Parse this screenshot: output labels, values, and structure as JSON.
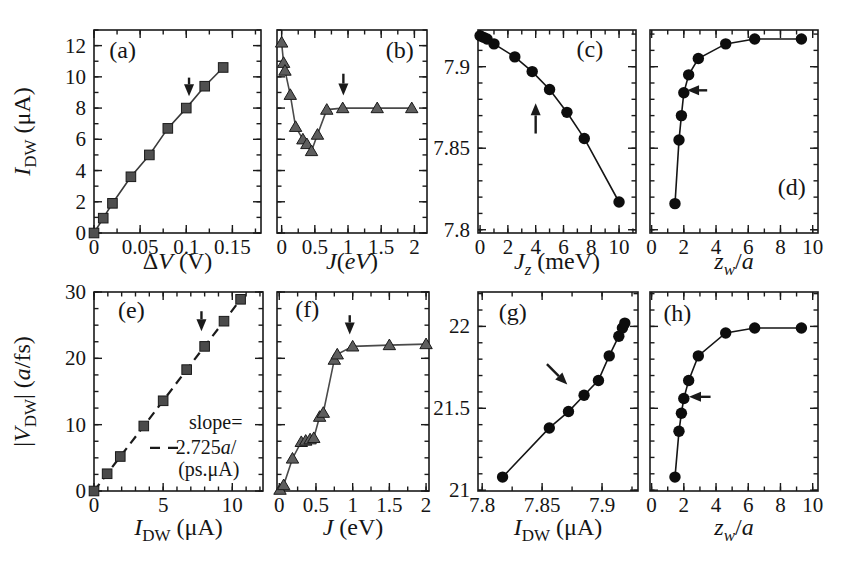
{
  "figure": {
    "width": 862,
    "height": 576,
    "background": "#ffffff",
    "axis_color": "#1a1a1a",
    "tick_font_size": 21,
    "title_font_size": 24,
    "label_font_size": 24
  },
  "chart_data": [
    {
      "id": "a",
      "type": "line",
      "label": "(a)",
      "label_xy": [
        0.031,
        11.2
      ],
      "rect": [
        94,
        30,
        261,
        233
      ],
      "x": {
        "lim": [
          0,
          0.181
        ],
        "major": [
          0,
          0.05,
          0.1,
          0.15
        ],
        "labels": [
          "0",
          "0.05",
          "0.1",
          "0.15"
        ],
        "minor": 0.025,
        "title": [
          [
            "Δ",
            "n"
          ],
          [
            "V",
            "i"
          ],
          [
            " (V)",
            "n"
          ]
        ],
        "title_dy": 36
      },
      "y": {
        "lim": [
          0,
          13
        ],
        "major": [
          0,
          2,
          4,
          6,
          8,
          10,
          12
        ],
        "labels": [
          "0",
          "2",
          "4",
          "6",
          "8",
          "10",
          "12"
        ],
        "minor": 1,
        "title": [
          [
            "I",
            "i"
          ],
          [
            "DW",
            "sub"
          ],
          [
            " (μA)",
            "n"
          ]
        ]
      },
      "series": {
        "marker": "square",
        "line": "solid",
        "line_color": "#3a3a3a",
        "marker_fill": "#4f4f4f",
        "points": [
          [
            0,
            0
          ],
          [
            0.01,
            0.95
          ],
          [
            0.02,
            1.9
          ],
          [
            0.04,
            3.6
          ],
          [
            0.06,
            5.0
          ],
          [
            0.08,
            6.7
          ],
          [
            0.1,
            8.0
          ],
          [
            0.12,
            9.4
          ],
          [
            0.14,
            10.6
          ]
        ]
      },
      "arrow": {
        "from": [
          0.103,
          9.95
        ],
        "to": [
          0.103,
          8.75
        ]
      }
    },
    {
      "id": "b",
      "type": "line",
      "label": "(b)",
      "label_xy": [
        1.78,
        11.2
      ],
      "rect": [
        277,
        30,
        427,
        233
      ],
      "x": {
        "lim": [
          -0.07,
          2.19
        ],
        "major": [
          0,
          0.5,
          1,
          1.5,
          2
        ],
        "labels": [
          "0",
          "0.5",
          "1",
          "1.5",
          "2"
        ],
        "minor": 0.25,
        "title": [
          [
            "J",
            "i"
          ],
          [
            "(",
            "n"
          ],
          [
            "eV",
            "i"
          ],
          [
            ")",
            "n"
          ]
        ],
        "title_dy": 36
      },
      "y": {
        "lim": [
          0,
          13
        ],
        "major": [
          0,
          2,
          4,
          6,
          8,
          10,
          12
        ],
        "labels": null,
        "minor": 1
      },
      "series": {
        "marker": "triangle",
        "line": "solid",
        "line_color": "#4a4a4a",
        "marker_fill": "#5e5e5e",
        "points": [
          [
            0,
            12.2
          ],
          [
            0.03,
            10.9
          ],
          [
            0.05,
            10.4
          ],
          [
            0.13,
            8.85
          ],
          [
            0.21,
            6.8
          ],
          [
            0.32,
            6.0
          ],
          [
            0.38,
            5.7
          ],
          [
            0.45,
            5.25
          ],
          [
            0.54,
            6.3
          ],
          [
            0.68,
            7.9
          ],
          [
            0.92,
            8.0
          ],
          [
            1.44,
            8.0
          ],
          [
            1.96,
            8.0
          ]
        ]
      },
      "arrow": {
        "from": [
          0.93,
          10.2
        ],
        "to": [
          0.93,
          8.8
        ]
      }
    },
    {
      "id": "c",
      "type": "line",
      "label": "(c)",
      "label_xy": [
        7.9,
        7.906
      ],
      "rect": [
        478,
        30,
        636,
        233
      ],
      "x": {
        "lim": [
          -0.15,
          11.22
        ],
        "major": [
          0,
          2,
          4,
          6,
          8,
          10
        ],
        "labels": [
          "0",
          "2",
          "4",
          "6",
          "8",
          "10"
        ],
        "minor": 1,
        "title": [
          [
            "J",
            "i"
          ],
          [
            "z",
            "subi"
          ],
          [
            " (meV)",
            "n"
          ]
        ],
        "title_dy": 36
      },
      "y": {
        "lim": [
          7.798,
          7.9225
        ],
        "major": [
          7.8,
          7.85,
          7.9
        ],
        "labels": [
          "7.8",
          "7.85",
          "7.9"
        ],
        "minor": 0.01
      },
      "series": {
        "marker": "circle",
        "line": "solid",
        "line_color": "#151515",
        "marker_fill": "#0d0d0d",
        "points": [
          [
            0,
            7.919
          ],
          [
            0.25,
            7.918
          ],
          [
            0.5,
            7.917
          ],
          [
            1,
            7.914
          ],
          [
            2.5,
            7.906
          ],
          [
            3.75,
            7.897
          ],
          [
            5,
            7.886
          ],
          [
            6.25,
            7.872
          ],
          [
            7.5,
            7.856
          ],
          [
            10,
            7.817
          ]
        ]
      },
      "arrow": {
        "from": [
          4.0,
          7.859
        ],
        "to": [
          4.0,
          7.8775
        ]
      }
    },
    {
      "id": "d",
      "type": "line",
      "label": "(d)",
      "label_xy": [
        8.7,
        7.8215
      ],
      "rect": [
        650,
        30,
        818,
        233
      ],
      "x": {
        "lim": [
          -0.1,
          10.33
        ],
        "major": [
          0,
          2,
          4,
          6,
          8,
          10
        ],
        "labels": [
          "0",
          "2",
          "4",
          "6",
          "8",
          "10"
        ],
        "minor": 1,
        "title": [
          [
            "z",
            "i"
          ],
          [
            "w",
            "subi"
          ],
          [
            "/",
            "n"
          ],
          [
            "a",
            "i"
          ]
        ],
        "title_dy": 36
      },
      "y": {
        "lim": [
          7.798,
          7.9225
        ],
        "major": [
          7.8,
          7.85,
          7.9
        ],
        "labels": null,
        "minor": 0.01
      },
      "series": {
        "marker": "circle",
        "line": "solid",
        "line_color": "#151515",
        "marker_fill": "#0d0d0d",
        "points": [
          [
            1.45,
            7.816
          ],
          [
            1.7,
            7.855
          ],
          [
            1.85,
            7.87
          ],
          [
            2.0,
            7.884
          ],
          [
            2.3,
            7.895
          ],
          [
            2.9,
            7.905
          ],
          [
            4.6,
            7.914
          ],
          [
            6.4,
            7.917
          ],
          [
            9.3,
            7.917
          ]
        ]
      },
      "arrow": {
        "from": [
          3.45,
          7.8855
        ],
        "to": [
          2.2,
          7.8855
        ]
      }
    },
    {
      "id": "e",
      "type": "line",
      "label": "(e)",
      "label_xy": [
        2.7,
        26.1
      ],
      "rect": [
        94,
        292,
        263,
        491
      ],
      "x": {
        "lim": [
          0,
          12.22
        ],
        "major": [
          0,
          5,
          10
        ],
        "labels": [
          "0",
          "5",
          "10"
        ],
        "minor": 1,
        "title": [
          [
            "I",
            "i"
          ],
          [
            "DW",
            "sub"
          ],
          [
            " (μA)",
            "n"
          ]
        ],
        "title_dy": 44
      },
      "y": {
        "lim": [
          0,
          30
        ],
        "major": [
          0,
          10,
          20,
          30
        ],
        "labels": [
          "0",
          "10",
          "20",
          "30"
        ],
        "minor": 2.5,
        "title": [
          [
            "|",
            "n"
          ],
          [
            "V",
            "i"
          ],
          [
            "DW",
            "sub"
          ],
          [
            "| (",
            "n"
          ],
          [
            "a",
            "i"
          ],
          [
            "/fs)",
            "n"
          ]
        ]
      },
      "series": {
        "marker": "square",
        "line": "dashed",
        "line_color": "#1a1a1a",
        "marker_fill": "#4a4a4a",
        "points": [
          [
            0,
            0
          ],
          [
            0.95,
            2.6
          ],
          [
            1.9,
            5.2
          ],
          [
            3.6,
            9.8
          ],
          [
            5.0,
            13.6
          ],
          [
            6.7,
            18.3
          ],
          [
            8.0,
            21.8
          ],
          [
            9.4,
            25.6
          ],
          [
            10.6,
            28.9
          ]
        ]
      },
      "arrow": {
        "from": [
          7.77,
          27.1
        ],
        "to": [
          7.77,
          24.1
        ]
      },
      "legend": {
        "dash": {
          "from": [
            4.05,
            6.5
          ],
          "to": [
            6.4,
            6.5
          ]
        },
        "lines": [
          {
            "xy": [
              8.8,
              9.3
            ],
            "segs": [
              [
                "slope=",
                "n"
              ]
            ]
          },
          {
            "xy": [
              8.1,
              5.6
            ],
            "segs": [
              [
                "2.725",
                "n"
              ],
              [
                "a",
                "i"
              ],
              [
                "/",
                "n"
              ]
            ]
          },
          {
            "xy": [
              8.3,
              2.2
            ],
            "segs": [
              [
                "(ps.μA)",
                "n"
              ]
            ]
          }
        ]
      }
    },
    {
      "id": "f",
      "type": "line",
      "label": "(f)",
      "label_xy": [
        0.38,
        26.2
      ],
      "rect": [
        277,
        292,
        429,
        491
      ],
      "x": {
        "lim": [
          -0.031,
          2.04
        ],
        "major": [
          0,
          0.5,
          1,
          1.5,
          2
        ],
        "labels": [
          "0",
          "0.5",
          "1",
          "1.5",
          "2"
        ],
        "minor": 0.25,
        "title": [
          [
            "J",
            "i"
          ],
          [
            " (eV)",
            "n"
          ]
        ],
        "title_dy": 44
      },
      "y": {
        "lim": [
          0,
          30
        ],
        "major": [
          0,
          10,
          20,
          30
        ],
        "labels": null,
        "minor": 2.5
      },
      "series": {
        "marker": "triangle",
        "line": "solid",
        "line_color": "#4a4a4a",
        "marker_fill": "#5e5e5e",
        "points": [
          [
            0.01,
            0.2
          ],
          [
            0.06,
            0.9
          ],
          [
            0.18,
            4.9
          ],
          [
            0.3,
            7.4
          ],
          [
            0.36,
            7.6
          ],
          [
            0.42,
            7.8
          ],
          [
            0.47,
            8.0
          ],
          [
            0.55,
            11.2
          ],
          [
            0.6,
            11.8
          ],
          [
            0.75,
            19.8
          ],
          [
            0.79,
            20.6
          ],
          [
            1.0,
            21.8
          ],
          [
            1.5,
            22.0
          ],
          [
            2.0,
            22.15
          ]
        ]
      },
      "arrow": {
        "from": [
          0.96,
          26.5
        ],
        "to": [
          0.96,
          23.6
        ]
      }
    },
    {
      "id": "g",
      "type": "line",
      "label": "(g)",
      "label_xy": [
        7.8255,
        22.04
      ],
      "rect": [
        478,
        292,
        638,
        491
      ],
      "x": {
        "lim": [
          7.7965,
          7.93
        ],
        "major": [
          7.8,
          7.85,
          7.9
        ],
        "labels": [
          "7.8",
          "7.85",
          "7.9"
        ],
        "minor": 0.025,
        "title": [
          [
            "I",
            "i"
          ],
          [
            "DW",
            "sub"
          ],
          [
            " (μA)",
            "n"
          ]
        ],
        "title_dy": 44
      },
      "y": {
        "lim": [
          20.995,
          22.21
        ],
        "major": [
          21,
          21.5,
          22
        ],
        "labels": [
          "21",
          "21.5",
          "22"
        ],
        "minor": 0.1
      },
      "series": {
        "marker": "circle",
        "line": "solid",
        "line_color": "#151515",
        "marker_fill": "#0d0d0d",
        "points": [
          [
            7.817,
            21.08
          ],
          [
            7.856,
            21.38
          ],
          [
            7.872,
            21.48
          ],
          [
            7.885,
            21.58
          ],
          [
            7.897,
            21.67
          ],
          [
            7.906,
            21.82
          ],
          [
            7.914,
            21.94
          ],
          [
            7.917,
            21.99
          ],
          [
            7.919,
            22.02
          ]
        ]
      },
      "arrow": {
        "from": [
          7.854,
          21.77
        ],
        "to": [
          7.871,
          21.645
        ]
      }
    },
    {
      "id": "h",
      "type": "line",
      "label": "(h)",
      "label_xy": [
        1.6,
        22.03
      ],
      "rect": [
        650,
        292,
        818,
        491
      ],
      "x": {
        "lim": [
          -0.1,
          10.33
        ],
        "major": [
          0,
          2,
          4,
          6,
          8,
          10
        ],
        "labels": [
          "0",
          "2",
          "4",
          "6",
          "8",
          "10"
        ],
        "minor": 1,
        "title": [
          [
            "z",
            "i"
          ],
          [
            "w",
            "subi"
          ],
          [
            "/",
            "n"
          ],
          [
            "a",
            "i"
          ]
        ],
        "title_dy": 44
      },
      "y": {
        "lim": [
          20.995,
          22.21
        ],
        "major": [
          21,
          21.5,
          22
        ],
        "labels": null,
        "minor": 0.1
      },
      "series": {
        "marker": "circle",
        "line": "solid",
        "line_color": "#151515",
        "marker_fill": "#0d0d0d",
        "points": [
          [
            1.45,
            21.08
          ],
          [
            1.7,
            21.36
          ],
          [
            1.85,
            21.47
          ],
          [
            2.0,
            21.56
          ],
          [
            2.3,
            21.67
          ],
          [
            2.9,
            21.82
          ],
          [
            4.6,
            21.96
          ],
          [
            6.4,
            21.99
          ],
          [
            9.3,
            21.99
          ]
        ]
      },
      "arrow": {
        "from": [
          3.66,
          21.57
        ],
        "to": [
          2.32,
          21.57
        ]
      }
    }
  ]
}
